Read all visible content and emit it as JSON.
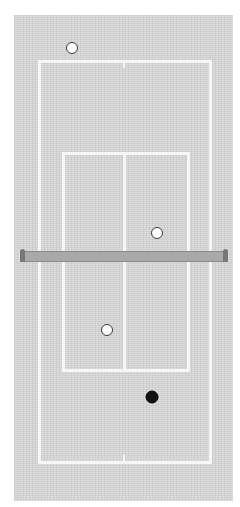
{
  "scene": {
    "type": "tennis-court-top-view",
    "court_color": "#d4d4d4",
    "line_color": "#f6f6f6",
    "net_color": "#a9a9a9"
  },
  "balls": [
    {
      "id": "ball-top",
      "color": "white",
      "x": 72,
      "y": 48
    },
    {
      "id": "ball-upper-right",
      "color": "white",
      "x": 157,
      "y": 233
    },
    {
      "id": "ball-lower-left",
      "color": "white",
      "x": 107,
      "y": 330
    },
    {
      "id": "ball-black",
      "color": "black",
      "x": 152,
      "y": 397
    }
  ]
}
